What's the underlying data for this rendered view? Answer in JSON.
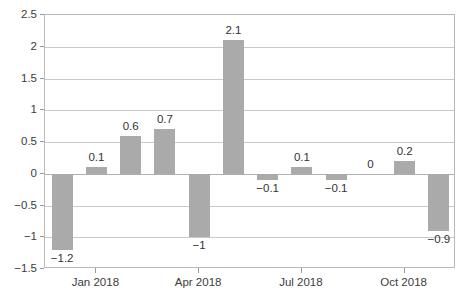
{
  "chart_data": {
    "type": "bar",
    "title": "",
    "subtitle": "",
    "xlabel": "",
    "ylabel": "",
    "ylim": [
      -1.5,
      2.5
    ],
    "ytick_values": [
      2.5,
      2,
      1.5,
      1,
      0.5,
      0,
      -0.5,
      -1,
      -1.5
    ],
    "ytick_labels": [
      "2.5",
      "2",
      "1.5",
      "1",
      "0.5",
      "0",
      "-0.5",
      "-1",
      "-1.5"
    ],
    "grid": true,
    "legend": null,
    "legend_position": "none",
    "bar_color": "#aaaaaa",
    "gridline_color": "#c9c9c9",
    "frame_color": "#b9b9b9",
    "categories": [
      "",
      "Jan 2018",
      "",
      "",
      "Apr 2018",
      "",
      "",
      "Jul 2018",
      "",
      "",
      "Oct 2018",
      ""
    ],
    "values": [
      -1.2,
      0.1,
      0.6,
      0.7,
      -1,
      2.1,
      -0.1,
      0.1,
      -0.1,
      0,
      0.2,
      -0.9
    ],
    "value_labels": [
      "−1.2",
      "0.1",
      "0.6",
      "0.7",
      "−1",
      "2.1",
      "−0.1",
      "0.1",
      "−0.1",
      "0",
      "0.2",
      "−0.9"
    ],
    "xtick_labels": [
      "Jan 2018",
      "Apr 2018",
      "Jul 2018",
      "Oct 2018"
    ],
    "xtick_indices": [
      1,
      4,
      7,
      10
    ]
  }
}
